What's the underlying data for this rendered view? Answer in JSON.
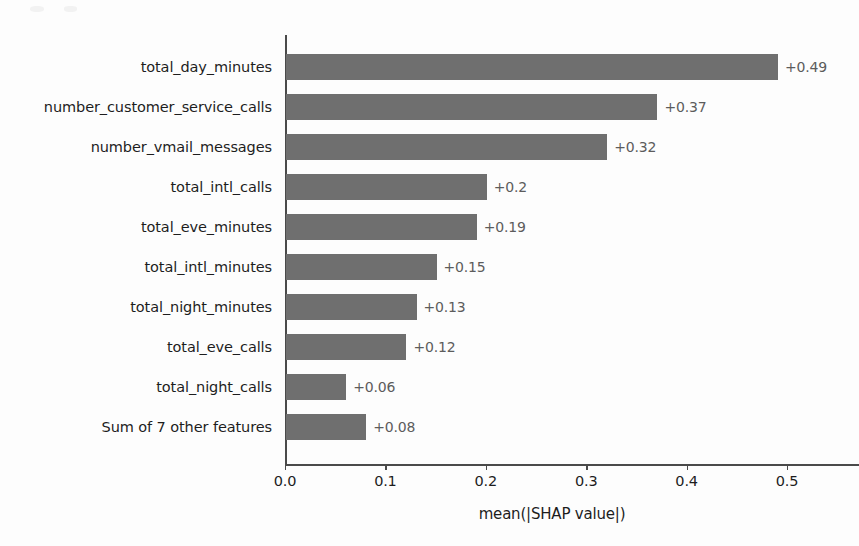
{
  "chart_data": {
    "type": "bar",
    "orientation": "horizontal",
    "title": "",
    "xlabel": "mean(|SHAP value|)",
    "ylabel": "",
    "xlim": [
      0.0,
      0.5
    ],
    "grid": false,
    "legend": null,
    "bar_color": "#6f6f6f",
    "xticks": [
      "0.0",
      "0.1",
      "0.2",
      "0.3",
      "0.4",
      "0.5"
    ],
    "xtick_values": [
      0.0,
      0.1,
      0.2,
      0.3,
      0.4,
      0.5
    ],
    "categories": [
      "total_day_minutes",
      "number_customer_service_calls",
      "number_vmail_messages",
      "total_intl_calls",
      "total_eve_minutes",
      "total_intl_minutes",
      "total_night_minutes",
      "total_eve_calls",
      "total_night_calls",
      "Sum of 7 other features"
    ],
    "values": [
      0.49,
      0.37,
      0.32,
      0.2,
      0.19,
      0.15,
      0.13,
      0.12,
      0.06,
      0.08
    ],
    "value_labels": [
      "+0.49",
      "+0.37",
      "+0.32",
      "+0.2",
      "+0.19",
      "+0.15",
      "+0.13",
      "+0.12",
      "+0.06",
      "+0.08"
    ]
  }
}
